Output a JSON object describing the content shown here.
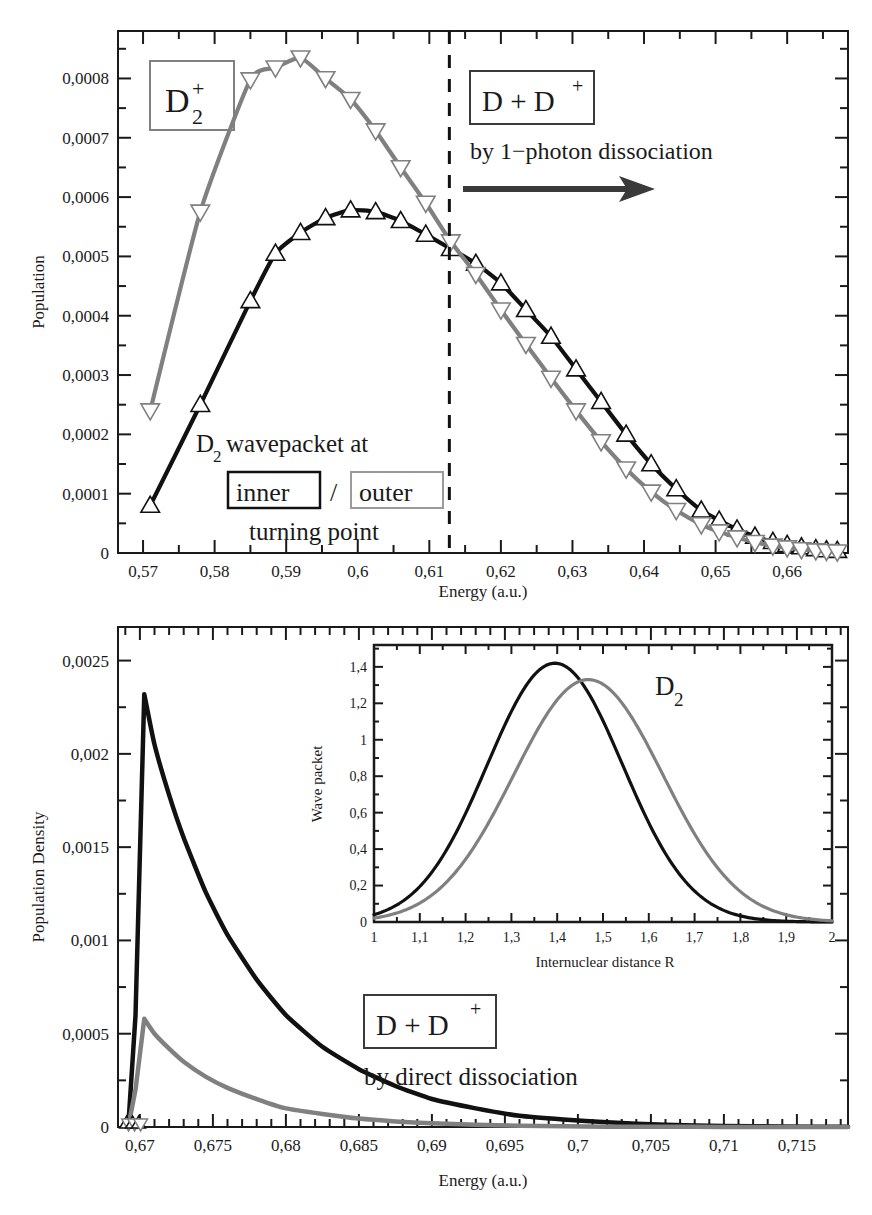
{
  "figure": {
    "gray": "#808080",
    "black": "#111111"
  },
  "chart_data": [
    {
      "id": "top-panel",
      "type": "line",
      "title": "",
      "xlabel": "Energy (a.u.)",
      "ylabel": "Population",
      "xlim": [
        0.5665,
        0.6685
      ],
      "ylim": [
        0,
        0.00088
      ],
      "xticks": [
        0.57,
        0.58,
        0.59,
        0.6,
        0.61,
        0.62,
        0.63,
        0.64,
        0.65,
        0.66
      ],
      "xticklabels": [
        "0,57",
        "0,58",
        "0,59",
        "0,6",
        "0,61",
        "0,62",
        "0,63",
        "0,64",
        "0,65",
        "0,66"
      ],
      "yticks": [
        0,
        0.0001,
        0.0002,
        0.0003,
        0.0004,
        0.0005,
        0.0006,
        0.0007,
        0.0008
      ],
      "yticklabels": [
        "0",
        "0,0001",
        "0,0002",
        "0,0003",
        "0,0004",
        "0,0005",
        "0,0006",
        "0,0007",
        "0,0008"
      ],
      "minor_ticks": true,
      "grid": false,
      "legend": "none",
      "vline": {
        "x": 0.6128,
        "style": "dashed",
        "color": "#111111"
      },
      "series": [
        {
          "name": "D2 wavepacket at inner turning point",
          "marker": "triangle-up",
          "color": "#111111",
          "x": [
            0.571,
            0.578,
            0.585,
            0.5885,
            0.592,
            0.5955,
            0.599,
            0.6025,
            0.606,
            0.6095,
            0.613,
            0.6165,
            0.62,
            0.6235,
            0.627,
            0.6305,
            0.634,
            0.6375,
            0.641,
            0.6445,
            0.648,
            0.6505,
            0.653,
            0.6555,
            0.658,
            0.66,
            0.662,
            0.664,
            0.6655,
            0.667
          ],
          "y": [
            8e-05,
            0.00025,
            0.000425,
            0.000505,
            0.00054,
            0.000565,
            0.000578,
            0.000575,
            0.00056,
            0.000537,
            0.000513,
            0.000488,
            0.000455,
            0.00041,
            0.000365,
            0.00031,
            0.000255,
            0.0002,
            0.00015,
            0.000108,
            7.2e-05,
            5.5e-05,
            4e-05,
            2.8e-05,
            1.9e-05,
            1.4e-05,
            1e-05,
            7e-06,
            5e-06,
            4e-06
          ]
        },
        {
          "name": "D2 wavepacket at outer turning point",
          "marker": "triangle-down",
          "color": "#808080",
          "x": [
            0.571,
            0.578,
            0.585,
            0.5885,
            0.592,
            0.5955,
            0.599,
            0.6025,
            0.606,
            0.6095,
            0.613,
            0.6165,
            0.62,
            0.6235,
            0.627,
            0.6305,
            0.634,
            0.6375,
            0.641,
            0.6445,
            0.648,
            0.6505,
            0.653,
            0.6555,
            0.658,
            0.66,
            0.662,
            0.664,
            0.6655,
            0.667
          ],
          "y": [
            0.00024,
            0.000575,
            0.000798,
            0.000818,
            0.000835,
            0.0008,
            0.000765,
            0.000712,
            0.00065,
            0.00059,
            0.000525,
            0.00047,
            0.00041,
            0.000352,
            0.000295,
            0.00024,
            0.000188,
            0.000142,
            0.000103,
            7.2e-05,
            4.8e-05,
            3.6e-05,
            2.6e-05,
            1.8e-05,
            1.2e-05,
            9e-06,
            6e-06,
            4e-06,
            3e-06,
            2e-06
          ]
        }
      ],
      "annotations": [
        {
          "id": "label-d2plus",
          "text_main": "D",
          "sub": "2",
          "sup": "+",
          "boxed": true,
          "box_color": "#808080"
        },
        {
          "id": "label-dplusd",
          "text_main": "D + D",
          "sup": "+",
          "boxed": true,
          "box_color": "#111111"
        },
        {
          "id": "label-1photon",
          "text": "by 1−photon dissociation"
        },
        {
          "id": "label-wavepacket-line1",
          "text_pre": "D",
          "sub": "2",
          "text_post": " wavepacket at"
        },
        {
          "id": "label-inner",
          "text": "inner",
          "boxed": true,
          "box_color": "#111111"
        },
        {
          "id": "label-slash",
          "text": "/"
        },
        {
          "id": "label-outer",
          "text": "outer",
          "boxed": true,
          "box_color": "#808080"
        },
        {
          "id": "label-turning-point",
          "text": "turning point"
        },
        {
          "id": "arrow-right",
          "text": ""
        }
      ]
    },
    {
      "id": "bottom-panel",
      "type": "line",
      "title": "",
      "xlabel": "Energy (a.u.)",
      "ylabel": "Population Density",
      "xlim": [
        0.6685,
        0.7185
      ],
      "ylim": [
        0,
        0.00268
      ],
      "xticks": [
        0.67,
        0.675,
        0.68,
        0.685,
        0.69,
        0.695,
        0.7,
        0.705,
        0.71,
        0.715
      ],
      "xticklabels": [
        "0,67",
        "0,675",
        "0,68",
        "0,685",
        "0,69",
        "0,695",
        "0,7",
        "0,705",
        "0,71",
        "0,715"
      ],
      "yticks": [
        0,
        0.0005,
        0.001,
        0.0015,
        0.002,
        0.0025
      ],
      "yticklabels": [
        "0",
        "0,0005",
        "0,001",
        "0,0015",
        "0,002",
        "0,0025"
      ],
      "minor_ticks": true,
      "grid": false,
      "legend": "none",
      "series": [
        {
          "name": "direct dissociation from inner turning point",
          "color": "#111111",
          "peak_x": 0.6703,
          "peak_y": 0.00232,
          "decay": "exponential",
          "x": [
            0.6692,
            0.6697,
            0.6703,
            0.671,
            0.672,
            0.673,
            0.6745,
            0.676,
            0.678,
            0.68,
            0.6825,
            0.685,
            0.6875,
            0.69,
            0.693,
            0.696,
            0.699,
            0.702,
            0.706,
            0.71,
            0.714,
            0.7185
          ],
          "y": [
            0.0,
            0.0006,
            0.00232,
            0.00205,
            0.00178,
            0.00155,
            0.00126,
            0.00103,
            0.00079,
            0.0006,
            0.00043,
            0.00031,
            0.00022,
            0.00015,
            0.0001,
            6e-05,
            4e-05,
            2.5e-05,
            1.2e-05,
            6e-06,
            3e-06,
            1e-06
          ]
        },
        {
          "name": "direct dissociation from outer turning point",
          "color": "#808080",
          "peak_x": 0.6703,
          "peak_y": 0.00058,
          "decay": "exponential",
          "x": [
            0.6692,
            0.6697,
            0.6703,
            0.671,
            0.672,
            0.673,
            0.6745,
            0.676,
            0.678,
            0.68,
            0.6825,
            0.685,
            0.6875,
            0.69,
            0.693,
            0.696,
            0.699,
            0.702,
            0.706,
            0.71,
            0.714,
            0.7185
          ],
          "y": [
            0.0,
            0.0002,
            0.00058,
            0.0005,
            0.00042,
            0.00035,
            0.00027,
            0.00021,
            0.00015,
            0.0001,
            7e-05,
            4.5e-05,
            3e-05,
            2e-05,
            1.2e-05,
            7e-06,
            4e-06,
            2e-06,
            1e-06,
            5e-07,
            2e-07,
            1e-07
          ]
        }
      ],
      "annotations": [
        {
          "id": "label-dplusd-bottom",
          "text_main": "D + D",
          "sup": "+",
          "boxed": true,
          "box_color": "#111111"
        },
        {
          "id": "label-direct",
          "text": "by direct dissociation"
        }
      ]
    },
    {
      "id": "inset-panel",
      "type": "line",
      "title": "",
      "xlabel": "Internuclear distance R",
      "ylabel": "Wave packet",
      "xlim": [
        1.0,
        2.0
      ],
      "ylim": [
        0,
        1.52
      ],
      "xticks": [
        1,
        1.1,
        1.2,
        1.3,
        1.4,
        1.5,
        1.6,
        1.7,
        1.8,
        1.9,
        2
      ],
      "xticklabels": [
        "1",
        "1,1",
        "1,2",
        "1,3",
        "1,4",
        "1,5",
        "1,6",
        "1,7",
        "1,8",
        "1,9",
        "2"
      ],
      "yticks": [
        0,
        0.2,
        0.4,
        0.6,
        0.8,
        1,
        1.2,
        1.4
      ],
      "yticklabels": [
        "0",
        "0,2",
        "0,4",
        "0,6",
        "0,8",
        "1",
        "1,2",
        "1,4"
      ],
      "minor_ticks": true,
      "grid": false,
      "legend": "none",
      "label": "D2",
      "label_text": "D",
      "label_sub": "2",
      "series": [
        {
          "name": "inner turning point wave packet",
          "color": "#111111",
          "center": 1.395,
          "amplitude": 1.42,
          "sigma": 0.148,
          "x": [
            1.0,
            1.05,
            1.1,
            1.15,
            1.2,
            1.25,
            1.3,
            1.35,
            1.395,
            1.44,
            1.49,
            1.54,
            1.59,
            1.64,
            1.69,
            1.74,
            1.79,
            1.84,
            1.9,
            1.95,
            2.0
          ],
          "y": [
            0.012,
            0.045,
            0.12,
            0.26,
            0.48,
            0.76,
            1.06,
            1.31,
            1.42,
            1.36,
            1.18,
            0.91,
            0.62,
            0.375,
            0.2,
            0.096,
            0.042,
            0.017,
            0.005,
            0.002,
            0.001
          ]
        },
        {
          "name": "outer turning point wave packet",
          "color": "#808080",
          "center": 1.468,
          "amplitude": 1.33,
          "sigma": 0.163,
          "x": [
            1.0,
            1.05,
            1.1,
            1.15,
            1.2,
            1.25,
            1.3,
            1.35,
            1.4,
            1.468,
            1.52,
            1.57,
            1.62,
            1.67,
            1.72,
            1.77,
            1.82,
            1.88,
            1.93,
            1.97,
            2.0
          ],
          "y": [
            0.002,
            0.01,
            0.035,
            0.09,
            0.2,
            0.38,
            0.62,
            0.89,
            1.14,
            1.33,
            1.29,
            1.15,
            0.94,
            0.7,
            0.47,
            0.285,
            0.155,
            0.062,
            0.025,
            0.012,
            0.006
          ]
        }
      ]
    }
  ]
}
